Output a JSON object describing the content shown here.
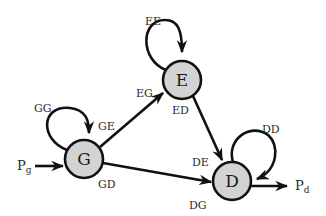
{
  "diagram": {
    "type": "state-transition",
    "colors": {
      "node_fill": "#d3d3d3",
      "stroke": "#111111",
      "background": "#ffffff"
    },
    "nodes": [
      {
        "id": "G",
        "label": "G"
      },
      {
        "id": "E",
        "label": "E"
      },
      {
        "id": "D",
        "label": "D"
      }
    ],
    "edge_labels": {
      "ee": "EE",
      "eg": "EG",
      "ed": "ED",
      "gg": "GG",
      "ge": "GE",
      "gd": "GD",
      "de": "DE",
      "dd": "DD",
      "dg": "DG"
    },
    "inputs": {
      "pg_base": "P",
      "pg_sub": "g"
    },
    "outputs": {
      "pd_base": "P",
      "pd_sub": "d"
    }
  }
}
